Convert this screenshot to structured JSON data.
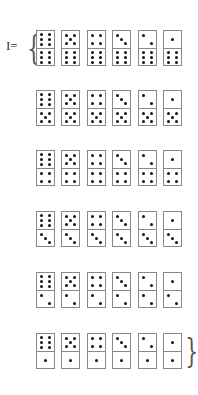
{
  "title": {
    "label": "I=",
    "open_brace": "{",
    "close_brace": "}"
  },
  "rows": [
    {
      "bottom": 6,
      "tops": [
        6,
        5,
        4,
        3,
        2,
        1
      ]
    },
    {
      "bottom": 5,
      "tops": [
        6,
        5,
        4,
        3,
        2,
        1
      ]
    },
    {
      "bottom": 4,
      "tops": [
        6,
        5,
        4,
        3,
        2,
        1
      ]
    },
    {
      "bottom": 3,
      "tops": [
        6,
        5,
        4,
        3,
        2,
        1
      ]
    },
    {
      "bottom": 2,
      "tops": [
        6,
        5,
        4,
        3,
        2,
        1
      ]
    },
    {
      "bottom": 1,
      "tops": [
        6,
        5,
        4,
        3,
        2,
        1
      ]
    }
  ],
  "layout": {
    "row_tops": [
      30,
      90,
      150,
      211,
      272,
      333
    ],
    "col_lefts": [
      0,
      25,
      51,
      76,
      102,
      127
    ]
  },
  "colors": {
    "pip": "#111111",
    "border": "#888888"
  }
}
